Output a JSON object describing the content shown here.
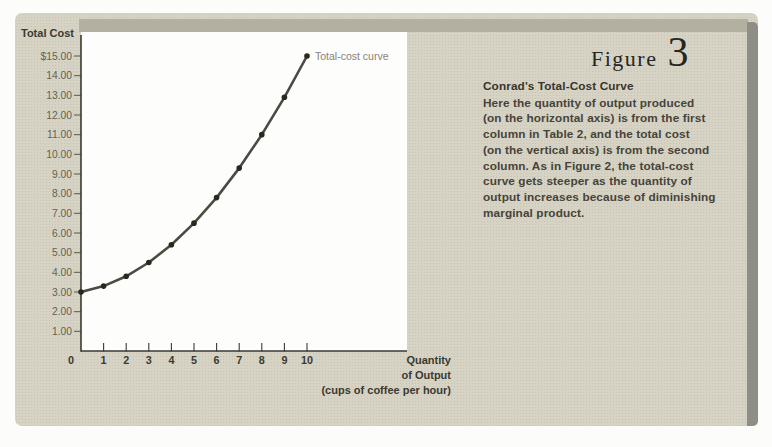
{
  "figure": {
    "label": "Figure",
    "number": "3",
    "caption_title": "Conrad's Total-Cost Curve",
    "caption_body": "Here the quantity of output produced\n(on the horizontal axis) is from the first\ncolumn in Table 2, and the total cost\n(on the vertical axis) is from the second\ncolumn. As in Figure 2, the total-cost\ncurve gets steeper as the quantity of\noutput increases because of diminishing\nmarginal product."
  },
  "chart_data": {
    "type": "line",
    "title": "",
    "ylabel": "Total Cost",
    "xlabel": "Quantity of Output (cups of coffee per hour)",
    "xlabel_lines": [
      "Quantity",
      "of Output",
      "(cups of coffee per hour)"
    ],
    "series": [
      {
        "name": "Total-cost curve",
        "x": [
          0,
          1,
          2,
          3,
          4,
          5,
          6,
          7,
          8,
          9,
          10
        ],
        "y": [
          3.0,
          3.3,
          3.8,
          4.5,
          5.4,
          6.5,
          7.8,
          9.3,
          11.0,
          12.9,
          15.0
        ]
      }
    ],
    "annotation": "Total-cost curve",
    "xlim": [
      0,
      10
    ],
    "ylim": [
      0,
      15
    ],
    "y_tick_labels": [
      "$15.00",
      "14.00",
      "13.00",
      "12.00",
      "11.00",
      "10.00",
      "9.00",
      "8.00",
      "7.00",
      "6.00",
      "5.00",
      "4.00",
      "3.00",
      "2.00",
      "1.00"
    ],
    "x_tick_labels": [
      "0",
      "1",
      "2",
      "3",
      "4",
      "5",
      "6",
      "7",
      "8",
      "9",
      "10"
    ],
    "grid": false,
    "legend_position": "annotation-at-last-point"
  },
  "colors": {
    "panel_bg": "#d7d3c4",
    "top_band": "#b4b0a1",
    "edge_bar": "#8e8e86",
    "plot_bg": "#fdfdfc",
    "axis_line": "#3a3a33",
    "axis_text": "#626255",
    "text_dark": "#3a3a31",
    "curve": "#4b4b44",
    "dot": "#28281f",
    "series_label": "#84847b",
    "figure_ink": "#26261f",
    "caption_text": "#46433a",
    "caption_title": "#38352b"
  }
}
